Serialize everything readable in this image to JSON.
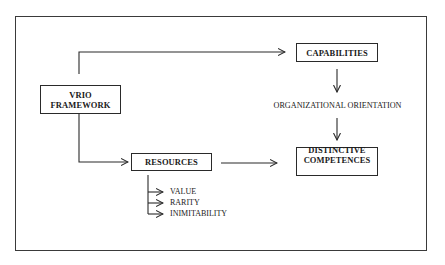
{
  "diagram": {
    "nodes": {
      "vrio": {
        "line1": "VRIO",
        "line2": "FRAMEWORK"
      },
      "capabilities": {
        "label": "CAPABILITIES"
      },
      "resources": {
        "label": "RESOURCES"
      },
      "distinctive": {
        "line1": "DISTINCTIVE",
        "line2": "COMPETENCES"
      }
    },
    "labels": {
      "organizational_orientation": "ORGANIZATIONAL ORIENTATION"
    },
    "resource_attributes": [
      "VALUE",
      "RARITY",
      "INIMITABILITY"
    ],
    "edges": [
      {
        "from": "VRIO FRAMEWORK",
        "to": "CAPABILITIES"
      },
      {
        "from": "VRIO FRAMEWORK",
        "to": "RESOURCES"
      },
      {
        "from": "CAPABILITIES",
        "to": "ORGANIZATIONAL ORIENTATION"
      },
      {
        "from": "ORGANIZATIONAL ORIENTATION",
        "to": "DISTINCTIVE COMPETENCES"
      },
      {
        "from": "RESOURCES",
        "to": "DISTINCTIVE COMPETENCES"
      },
      {
        "from": "RESOURCES",
        "to": "VALUE"
      },
      {
        "from": "RESOURCES",
        "to": "RARITY"
      },
      {
        "from": "RESOURCES",
        "to": "INIMITABILITY"
      }
    ],
    "colors": {
      "line": "#2a2a2a",
      "background": "#ffffff"
    }
  }
}
